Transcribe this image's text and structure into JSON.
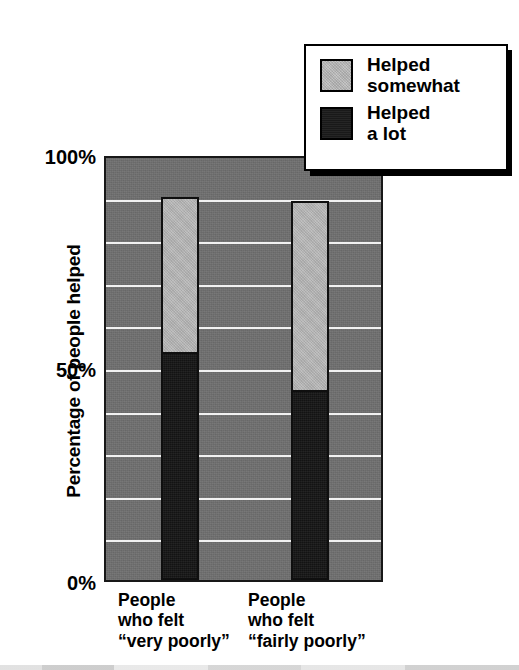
{
  "chart_data": {
    "type": "bar",
    "subtype": "stacked-vertical",
    "title": "",
    "xlabel": "",
    "ylabel": "Percentage of people helped",
    "ylim": [
      0,
      100
    ],
    "ytick_labels": [
      "0%",
      "50%",
      "100%"
    ],
    "ytick_values": [
      0,
      50,
      100
    ],
    "grid": true,
    "gridlines_every": 10,
    "gridline_values": [
      10,
      20,
      30,
      40,
      50,
      60,
      70,
      80,
      90
    ],
    "legend_position": "top-right",
    "categories": [
      "People who felt “very poorly”",
      "People who felt “fairly poorly”"
    ],
    "series": [
      {
        "name": "Helped a lot",
        "values": [
          54,
          45
        ],
        "color": "#151515"
      },
      {
        "name": "Helped somewhat",
        "values": [
          36,
          44
        ],
        "color": "#b9b9b9"
      }
    ],
    "totals": [
      90,
      89
    ],
    "plot_background_color": "#6f6f6f",
    "gridline_color": "#f2f2f2"
  },
  "axes": {
    "y_title": "Percentage of people helped",
    "y_ticks": [
      {
        "label": "100%",
        "value": 100
      },
      {
        "label": "50%",
        "value": 50
      },
      {
        "label": "0%",
        "value": 0
      }
    ]
  },
  "x_labels": [
    {
      "line1": "People",
      "line2": "who felt",
      "line3_open_quote": "“",
      "line3_emphasis": "very",
      "line3_rest": " poorly",
      "line3_close_quote": "”"
    },
    {
      "line1": "People",
      "line2": "who felt",
      "line3_open_quote": "“",
      "line3_emphasis": "fairly",
      "line3_rest": " poorly",
      "line3_close_quote": "”"
    }
  ],
  "legend": {
    "items": [
      {
        "label": "Helped\nsomewhat",
        "swatch": "light-gray-swatch",
        "color": "#bdbdbd"
      },
      {
        "label": "Helped\na lot",
        "swatch": "dark-swatch",
        "color": "#1a1a1a"
      }
    ]
  }
}
